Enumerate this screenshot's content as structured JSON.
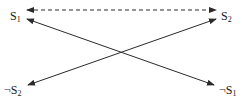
{
  "diagram": {
    "type": "state-transition",
    "nodes": [
      {
        "id": "s1",
        "base": "S",
        "sub": "1",
        "negated": false,
        "prefix": ""
      },
      {
        "id": "s2",
        "base": "S",
        "sub": "2",
        "negated": false,
        "prefix": ""
      },
      {
        "id": "not_s2",
        "base": "S",
        "sub": "2",
        "negated": true,
        "prefix": "¬"
      },
      {
        "id": "not_s1",
        "base": "S",
        "sub": "1",
        "negated": true,
        "prefix": "¬"
      }
    ],
    "edges": [
      {
        "from": "s1",
        "to": "s2",
        "style": "dashed",
        "arrows": "both"
      },
      {
        "from": "s1",
        "to": "not_s1",
        "style": "solid",
        "arrows": "both"
      },
      {
        "from": "not_s2",
        "to": "s2",
        "style": "solid",
        "arrows": "both"
      }
    ],
    "colors": {
      "line": "#2a2a2a",
      "text": "#1a1a1a",
      "background": "#ffffff"
    }
  },
  "labels": {
    "s1": {
      "base": "S",
      "sub": "1"
    },
    "s2": {
      "base": "S",
      "sub": "2"
    },
    "not_s2": {
      "prefix": "¬",
      "base": "S",
      "sub": "2"
    },
    "not_s1": {
      "prefix": "¬",
      "base": "S",
      "sub": "1"
    }
  }
}
